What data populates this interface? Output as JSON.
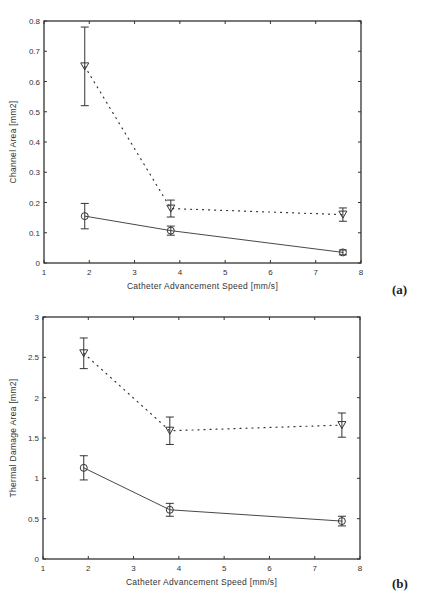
{
  "chart_data": [
    {
      "panel": "(a)",
      "type": "line",
      "title": "",
      "xlabel": "Catheter Advancement Speed [mm/s]",
      "ylabel": "Channel Area [mm2]",
      "xlim": [
        1,
        8
      ],
      "ylim": [
        0,
        0.8
      ],
      "xticks": [
        1,
        2,
        3,
        4,
        5,
        6,
        7,
        8
      ],
      "yticks": [
        0,
        0.1,
        0.2,
        0.3,
        0.4,
        0.5,
        0.6,
        0.7,
        0.8
      ],
      "ytick_labels": [
        "0",
        "0.1",
        "0.2",
        "0.3",
        "0.4",
        "0.5",
        "0.6",
        "0.7",
        "0.8"
      ],
      "grid": false,
      "legend": null,
      "x": [
        1.9,
        3.8,
        7.6
      ],
      "series": [
        {
          "name": "triangle (dotted)",
          "marker": "triangle-down",
          "linestyle": "dotted",
          "values": [
            0.65,
            0.18,
            0.16
          ],
          "errors": [
            0.13,
            0.028,
            0.022
          ]
        },
        {
          "name": "circle (solid)",
          "marker": "circle",
          "linestyle": "solid",
          "values": [
            0.155,
            0.107,
            0.035
          ],
          "errors": [
            0.042,
            0.015,
            0.008
          ]
        }
      ]
    },
    {
      "panel": "(b)",
      "type": "line",
      "title": "",
      "xlabel": "Catheter Advancement Speed [mm/s]",
      "ylabel": "Thermal Damage Area [mm2]",
      "xlim": [
        1,
        8
      ],
      "ylim": [
        0,
        3
      ],
      "xticks": [
        1,
        2,
        3,
        4,
        5,
        6,
        7,
        8
      ],
      "yticks": [
        0,
        0.5,
        1,
        1.5,
        2,
        2.5,
        3
      ],
      "ytick_labels": [
        "0",
        "0.5",
        "1",
        "1.5",
        "2",
        "2.5",
        "3"
      ],
      "grid": false,
      "legend": null,
      "x": [
        1.9,
        3.8,
        7.6
      ],
      "series": [
        {
          "name": "triangle (dotted)",
          "marker": "triangle-down",
          "linestyle": "dotted",
          "values": [
            2.55,
            1.59,
            1.66
          ],
          "errors": [
            0.19,
            0.17,
            0.15
          ]
        },
        {
          "name": "circle (solid)",
          "marker": "circle",
          "linestyle": "solid",
          "values": [
            1.13,
            0.61,
            0.47
          ],
          "errors": [
            0.15,
            0.08,
            0.06
          ]
        }
      ]
    }
  ],
  "panels": {
    "a_label": "(a)",
    "b_label": "(b)"
  }
}
